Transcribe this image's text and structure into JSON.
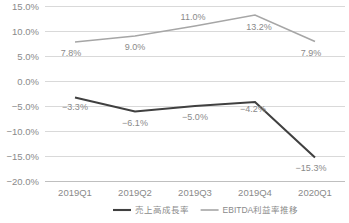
{
  "chart_data": {
    "type": "line",
    "title": "",
    "xlabel": "",
    "ylabel": "",
    "categories": [
      "2019Q1",
      "2019Q2",
      "2019Q3",
      "2019Q4",
      "2020Q1"
    ],
    "ylim": [
      -20.0,
      15.0
    ],
    "ytick_labels": [
      "15.0%",
      "10.0%",
      "5.0%",
      "0.0%",
      "−5.0%",
      "−10.0%",
      "−15.0%",
      "−20.0%"
    ],
    "ytick_values": [
      15.0,
      10.0,
      5.0,
      0.0,
      -5.0,
      -10.0,
      -15.0,
      -20.0
    ],
    "grid": true,
    "legend_position": "bottom",
    "series": [
      {
        "name": "売上高成長率",
        "color": "#404040",
        "values": [
          -3.3,
          -6.1,
          -5.0,
          -4.2,
          -15.3
        ],
        "labels": [
          "−3.3%",
          "−6.1%",
          "−5.0%",
          "−4.2%",
          "−15.3%"
        ]
      },
      {
        "name": "EBITDA利益率推移",
        "color": "#a6a6a6",
        "values": [
          7.8,
          9.0,
          11.0,
          13.2,
          7.9
        ],
        "labels": [
          "7.8%",
          "9.0%",
          "11.0%",
          "13.2%",
          "7.9%"
        ]
      }
    ]
  },
  "legend": {
    "items": [
      {
        "label": "売上高成長率",
        "color": "#404040"
      },
      {
        "label": "EBITDA利益率推移",
        "color": "#a6a6a6"
      }
    ]
  },
  "colors": {
    "revenue_growth": "#404040",
    "ebitda_margin": "#a6a6a6",
    "gridline": "#d9d9d9",
    "text": "#8a8a8a",
    "background": "#ffffff"
  }
}
